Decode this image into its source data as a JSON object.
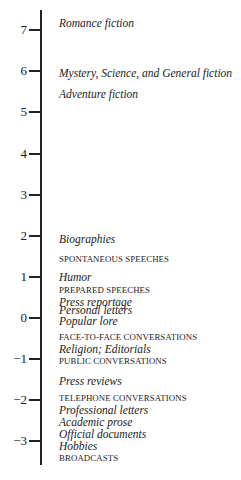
{
  "chart_data": {
    "type": "scatter",
    "title": "",
    "xlabel": "",
    "ylabel": "",
    "orientation": "vertical-axis-with-labels",
    "ylim": [
      -3.4,
      7.5
    ],
    "ticks": [
      7,
      6,
      5,
      4,
      3,
      2,
      1,
      0,
      -1,
      -2,
      -3
    ],
    "tick_labels": [
      "7",
      "6",
      "5",
      "4",
      "3",
      "2",
      "1",
      "0",
      "−1",
      "−2",
      "−3"
    ],
    "grid": false,
    "legend": null,
    "points": [
      {
        "label": "Romance fiction",
        "value": 7.2,
        "style": "italic",
        "y": 23
      },
      {
        "label": "Mystery, Science, and General fiction",
        "value": 5.95,
        "style": "italic",
        "y": 73
      },
      {
        "label": "Adventure fiction",
        "value": 5.4,
        "style": "italic",
        "y": 94
      },
      {
        "label": "Biographies",
        "value": 1.9,
        "style": "italic",
        "y": 239
      },
      {
        "label": "SPONTANEOUS SPEECHES",
        "value": 1.4,
        "style": "caps",
        "y": 259
      },
      {
        "label": "Humor",
        "value": 1.0,
        "style": "italic",
        "y": 277
      },
      {
        "label": "PREPARED SPEECHES",
        "value": 0.7,
        "style": "caps",
        "y": 290
      },
      {
        "label": "Press reportage",
        "value": 0.4,
        "style": "italic",
        "y": 302
      },
      {
        "label": "Personal letters",
        "value": 0.2,
        "style": "italic",
        "y": 309.5
      },
      {
        "label": "Popular lore",
        "value": -0.1,
        "style": "italic",
        "y": 321
      },
      {
        "label": "FACE-TO-FACE CONVERSATIONS",
        "value": -0.5,
        "style": "caps",
        "y": 337
      },
      {
        "label": "Religion; Editorials",
        "value": -0.8,
        "style": "italic",
        "y": 349
      },
      {
        "label": "PUBLIC CONVERSATIONS",
        "value": -1.1,
        "style": "caps",
        "y": 361
      },
      {
        "label": "Press reviews",
        "value": -1.5,
        "style": "italic",
        "y": 381
      },
      {
        "label": "TELEPHONE CONVERSATIONS",
        "value": -1.9,
        "style": "caps",
        "y": 398
      },
      {
        "label": "Professional letters",
        "value": -2.2,
        "style": "italic",
        "y": 410
      },
      {
        "label": "Academic prose",
        "value": -2.5,
        "style": "italic",
        "y": 422
      },
      {
        "label": "Official documents",
        "value": -2.8,
        "style": "italic",
        "y": 434
      },
      {
        "label": "Hobbies",
        "value": -3.1,
        "style": "italic",
        "y": 446
      },
      {
        "label": "BROADCASTS",
        "value": -3.4,
        "style": "caps",
        "y": 458
      }
    ]
  },
  "axis": {
    "tick_positions_px": [
      30,
      71,
      112,
      154,
      195,
      236,
      277,
      318,
      359,
      400,
      441
    ]
  }
}
